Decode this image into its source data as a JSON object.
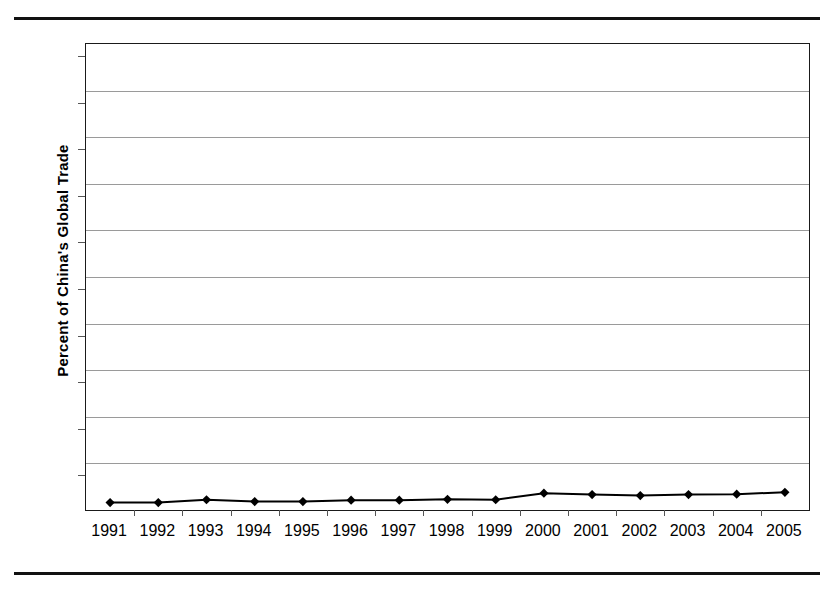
{
  "figure": {
    "y_axis_title": "Percent of China's Global Trade",
    "top_rule": "horizontal-rule",
    "bottom_rule": "horizontal-rule"
  },
  "chart_data": {
    "type": "line",
    "title": "",
    "xlabel": "",
    "ylabel": "Percent of China's Global Trade",
    "categories": [
      "1991",
      "1992",
      "1993",
      "1994",
      "1995",
      "1996",
      "1997",
      "1998",
      "1999",
      "2000",
      "2001",
      "2002",
      "2003",
      "2004",
      "2005"
    ],
    "values": [
      1.6,
      1.6,
      2.2,
      1.8,
      1.8,
      2.1,
      2.1,
      2.3,
      2.2,
      3.6,
      3.3,
      3.1,
      3.3,
      3.4,
      3.8
    ],
    "series": [
      {
        "name": "Percent of China's Global Trade",
        "values": [
          1.6,
          1.6,
          2.2,
          1.8,
          1.8,
          2.1,
          2.1,
          2.3,
          2.2,
          3.6,
          3.3,
          3.1,
          3.3,
          3.4,
          3.8
        ],
        "color": "#000000",
        "marker": "diamond",
        "line_width": 2
      }
    ],
    "ylim": [
      0,
      100
    ],
    "yticks": [
      0,
      10,
      20,
      30,
      40,
      50,
      60,
      70,
      80,
      90,
      100
    ],
    "ytick_labels": [
      "0",
      "10",
      "20",
      "30",
      "40",
      "50",
      "60",
      "70",
      "80",
      "90",
      "100"
    ],
    "grid": true,
    "grid_axis": "y",
    "grid_color": "#9a9a9a",
    "legend": false,
    "legend_position": "none",
    "plot_border_color": "#1a1a1a",
    "background_color": "#ffffff"
  }
}
